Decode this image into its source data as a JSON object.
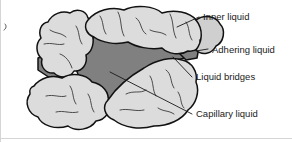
{
  "figure": {
    "type": "schematic-diagram",
    "width": 292,
    "height": 142,
    "background_color": "#ffffff"
  },
  "colors": {
    "particle_fill": "#dcdcdc",
    "particle_fill_shade": "#cfcfcf",
    "liquid_fill": "#808080",
    "outline": "#111111",
    "crack": "#3a3a3a",
    "text": "#1a1a1a",
    "frame": "#d5d5d5"
  },
  "labels": [
    {
      "id": "inner-liquid",
      "text": "Inner liquid",
      "text_x": 203,
      "text_y": 20,
      "leader": "M177,27 L199,17"
    },
    {
      "id": "adhering-liquid",
      "text": "Adhering liquid",
      "text_x": 212,
      "text_y": 53,
      "leader": "M196,51 L208,49"
    },
    {
      "id": "liquid-bridges",
      "text": "Liquid bridges",
      "text_x": 196,
      "text_y": 80,
      "leader": "M173,57 L192,77"
    },
    {
      "id": "capillary-liquid",
      "text": "Capillary liquid",
      "text_x": 196,
      "text_y": 117,
      "leader": "M110,72 L192,114"
    }
  ],
  "particles": [
    {
      "id": "particle-upper-left",
      "name": "upper-left-particle",
      "fill": "#dcdcdc"
    },
    {
      "id": "particle-top",
      "name": "top-large-particle",
      "fill": "#dcdcdc"
    },
    {
      "id": "particle-lower-left",
      "name": "lower-left-particle",
      "fill": "#dcdcdc"
    },
    {
      "id": "particle-lower-right",
      "name": "lower-right-particle",
      "fill": "#dcdcdc"
    },
    {
      "id": "particle-right-edge",
      "name": "right-edge-particle",
      "fill": "#cfcfcf"
    }
  ],
  "liquid_regions": [
    {
      "id": "capillary-pore",
      "name": "central-capillary-liquid-region",
      "fill": "#808080"
    },
    {
      "id": "left-pore",
      "name": "left-capillary-liquid-region",
      "fill": "#808080"
    }
  ]
}
